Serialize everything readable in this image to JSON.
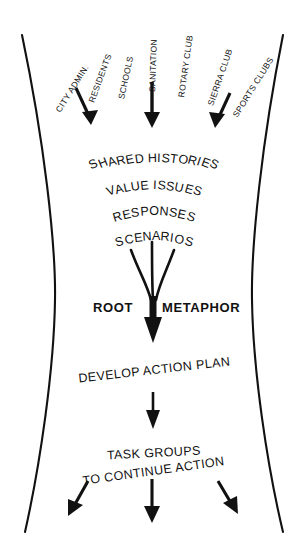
{
  "diagram": {
    "shape": "hourglass",
    "stroke_color": "#111111",
    "background_color": "#ffffff",
    "source_labels": [
      {
        "text": "CITY ADMIN.",
        "angle": -60
      },
      {
        "text": "RESIDENTS",
        "angle": -70
      },
      {
        "text": "SCHOOLS",
        "angle": -78
      },
      {
        "text": "SANITATION",
        "angle": -88
      },
      {
        "text": "ROTARY CLUB",
        "angle": -83
      },
      {
        "text": "SIERRA CLUB",
        "angle": -72
      },
      {
        "text": "SPORTS CLUBS",
        "angle": -60
      }
    ],
    "inflow_arrows": [
      {
        "name": "left-inflow-arrow",
        "angle": 34
      },
      {
        "name": "center-inflow-arrow",
        "angle": 0
      },
      {
        "name": "right-inflow-arrow",
        "angle": -34
      }
    ],
    "arc_stages": [
      "SHARED HISTORIES",
      "VALUE ISSUES",
      "RESPONSES",
      "SCENARIOS"
    ],
    "convergence": {
      "label_left": "ROOT",
      "label_right": "METAPHOR",
      "funnel_branches": 3
    },
    "action_stage": "DEVELOP ACTION PLAN",
    "outcome_stage": {
      "line1": "TASK GROUPS",
      "line2": "TO CONTINUE ACTION"
    },
    "outflow_arrows": [
      {
        "name": "left-outflow-arrow",
        "angle": -32
      },
      {
        "name": "center-outflow-arrow",
        "angle": 0
      },
      {
        "name": "right-outflow-arrow",
        "angle": 32
      }
    ]
  }
}
